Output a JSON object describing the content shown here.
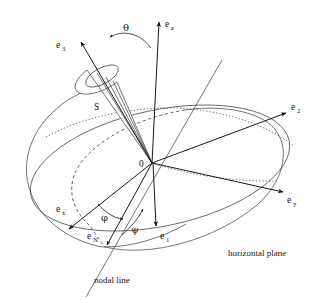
{
  "figure": {
    "background_color": "#ffffff",
    "line_color": "#2a2a2a",
    "width": 316,
    "height": 303
  },
  "labels": {
    "e_z": {
      "base": "e",
      "sub": "z",
      "x": 168,
      "y": 26
    },
    "e_3": {
      "base": "e",
      "sub": "3",
      "x": 60,
      "y": 47
    },
    "e_2": {
      "base": "e",
      "sub": "2",
      "x": 292,
      "y": 110
    },
    "e_y": {
      "base": "e",
      "sub": "y",
      "x": 288,
      "y": 203
    },
    "e_x": {
      "base": "e",
      "sub": "x",
      "x": 58,
      "y": 212
    },
    "e_N": {
      "base": "e",
      "sub": "N",
      "x": 90,
      "y": 239
    },
    "e_1": {
      "base": "e",
      "sub": "1",
      "x": 162,
      "y": 239
    },
    "S": {
      "text": "S",
      "x": 96,
      "y": 108
    },
    "O": {
      "text": "0",
      "x": 142,
      "y": 167
    },
    "theta": {
      "text": "θ",
      "x": 126,
      "y": 30
    },
    "phi": {
      "text": "φ",
      "x": 105,
      "y": 219
    },
    "psi": {
      "text": "ψ",
      "x": 134,
      "y": 232
    },
    "nodal_line": {
      "text": "nodal line",
      "x": 94,
      "y": 282
    },
    "horizontal_plane": {
      "text": "horizontal plane",
      "x": 228,
      "y": 256
    }
  },
  "geometry": {
    "origin": {
      "x": 152,
      "y": 163
    },
    "axis_ez_tip": {
      "x": 159,
      "y": 18
    },
    "axis_e3_tip": {
      "x": 80,
      "y": 40
    },
    "axis_e2_tip": {
      "x": 287,
      "y": 112
    },
    "axis_ey_tip": {
      "x": 284,
      "y": 191
    },
    "axis_ex_tip": {
      "x": 68,
      "y": 230
    },
    "axis_e1_tip": {
      "x": 157,
      "y": 230
    },
    "node_point": {
      "x": 105,
      "y": 247
    },
    "cone_apex": {
      "x": 152,
      "y": 163
    },
    "cone_base_center": {
      "x": 102,
      "y": 76
    },
    "cone_base_rx": 18,
    "cone_base_ry": 8,
    "cone_base_rotation": -28
  }
}
